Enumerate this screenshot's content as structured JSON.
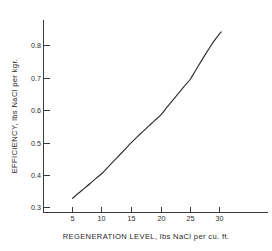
{
  "chart_data": {
    "type": "line",
    "title": "",
    "xlabel": "REGENERATION  LEVEL, lbs NaCl per cu. ft.",
    "ylabel": "EFFICIENCY, lbs NaCl per kgr.",
    "xlim": [
      0,
      35
    ],
    "ylim": [
      0.25,
      0.875
    ],
    "grid": false,
    "legend": false,
    "x_ticks": [
      5,
      10,
      15,
      20,
      25,
      30
    ],
    "x_tick_labels": [
      "5",
      "10",
      "15",
      "20",
      "25",
      "30"
    ],
    "y_ticks": [
      0.3,
      0.4,
      0.5,
      0.6,
      0.7,
      0.8
    ],
    "y_tick_labels": [
      "0.3",
      "0.4",
      "0.5",
      "0.6",
      "0.7",
      "0.8"
    ],
    "series": [
      {
        "name": "efficiency",
        "color": "#2e2e2e",
        "x": [
          5,
          6,
          7,
          8,
          9,
          10,
          11,
          12,
          13,
          14,
          15,
          16,
          17,
          18,
          19,
          20,
          21,
          22,
          23,
          24,
          25,
          26,
          27,
          28,
          29,
          30,
          30.3
        ],
        "values": [
          0.328,
          0.344,
          0.359,
          0.374,
          0.39,
          0.405,
          0.424,
          0.443,
          0.462,
          0.481,
          0.5,
          0.518,
          0.535,
          0.552,
          0.569,
          0.585,
          0.608,
          0.63,
          0.652,
          0.674,
          0.695,
          0.725,
          0.755,
          0.784,
          0.812,
          0.836,
          0.842
        ]
      }
    ]
  },
  "figure": {
    "background_color": "#ffffff",
    "axis_color": "#3a3a3a",
    "curve_color": "#2e2e2e"
  }
}
